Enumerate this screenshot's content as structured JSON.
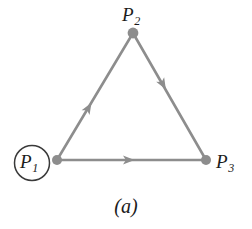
{
  "figure": {
    "caption": "(a)",
    "background_color": "#ffffff",
    "edge_color": "#8d8d8d",
    "node_color": "#8d8d8d",
    "label_color": "#1b1b1b",
    "circle_color": "#3a3a3a"
  },
  "graph": {
    "type": "directed-triangle",
    "nodes": [
      {
        "id": "P1",
        "label": "P",
        "subscript": "1",
        "x": 57,
        "y": 160,
        "circled": true
      },
      {
        "id": "P2",
        "label": "P",
        "subscript": "2",
        "x": 133,
        "y": 33,
        "circled": false
      },
      {
        "id": "P3",
        "label": "P",
        "subscript": "3",
        "x": 206,
        "y": 160,
        "circled": false
      }
    ],
    "edges": [
      {
        "from": "P1",
        "to": "P2",
        "directed": true,
        "arrow_position": 0.45
      },
      {
        "from": "P2",
        "to": "P3",
        "directed": true,
        "arrow_position": 0.45
      },
      {
        "from": "P1",
        "to": "P3",
        "directed": true,
        "arrow_position": 0.48
      }
    ]
  }
}
